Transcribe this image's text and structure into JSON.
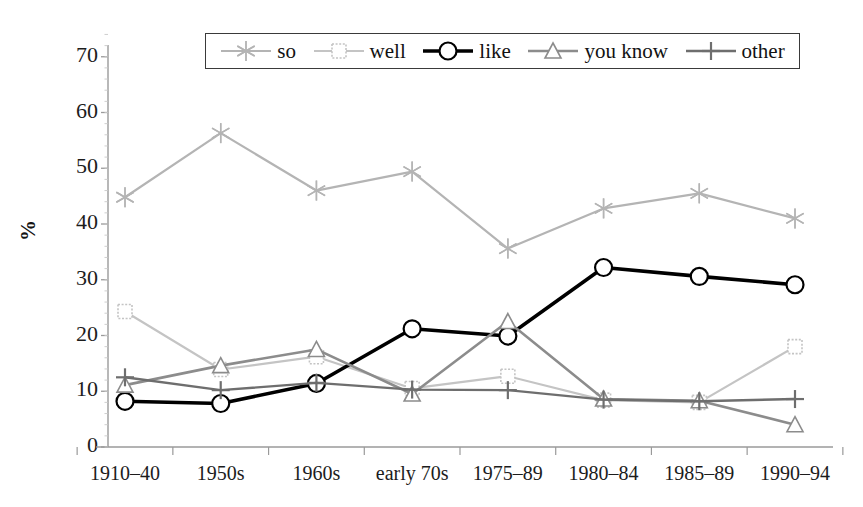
{
  "chart_data": {
    "type": "line",
    "title": "",
    "xlabel": "",
    "ylabel": "%",
    "ylim": [
      0,
      70
    ],
    "yticks": [
      0,
      10,
      20,
      30,
      40,
      50,
      60,
      70
    ],
    "grid": false,
    "legend_position": "top-center",
    "categories": [
      "1910–40",
      "1950s",
      "1960s",
      "early 70s",
      "1975–89",
      "1980–84",
      "1985–89",
      "1990–94"
    ],
    "series": [
      {
        "name": "so",
        "marker": "asterisk",
        "color": "#b4b4b4",
        "line_width": 2.2,
        "values": [
          44.8,
          56.3,
          46.0,
          49.4,
          35.6,
          42.8,
          45.5,
          41.0
        ]
      },
      {
        "name": "well",
        "marker": "square",
        "color": "#c4c4c4",
        "line_width": 2.2,
        "values": [
          24.3,
          13.9,
          16.2,
          10.5,
          12.7,
          8.4,
          8.0,
          18.0
        ]
      },
      {
        "name": "like",
        "marker": "circle",
        "color": "#000000",
        "line_width": 3.6,
        "values": [
          8.2,
          7.8,
          11.4,
          21.2,
          19.9,
          32.2,
          30.6,
          29.1
        ]
      },
      {
        "name": "you know",
        "marker": "triangle",
        "color": "#8c8c8c",
        "line_width": 2.6,
        "values": [
          11.1,
          14.6,
          17.5,
          9.5,
          22.5,
          8.6,
          8.3,
          4.0
        ]
      },
      {
        "name": "other",
        "marker": "plus",
        "color": "#6e6e6e",
        "line_width": 2.4,
        "values": [
          12.5,
          10.2,
          11.5,
          10.3,
          10.2,
          8.5,
          8.2,
          8.6
        ]
      }
    ]
  },
  "legend": {
    "items": [
      {
        "label": "so"
      },
      {
        "label": "well"
      },
      {
        "label": "like"
      },
      {
        "label": "you know"
      },
      {
        "label": "other"
      }
    ]
  },
  "axes": {
    "y_label": "%",
    "y_tick_labels": [
      "70",
      "60",
      "50",
      "40",
      "30",
      "20",
      "10",
      "0"
    ],
    "x_tick_labels": [
      "1910–40",
      "1950s",
      "1960s",
      "early 70s",
      "1975–89",
      "1980–84",
      "1985–89",
      "1990–94"
    ]
  },
  "colors": {
    "axis": "#9a9a9a",
    "text": "#1c1c1c",
    "so": "#b4b4b4",
    "well": "#c4c4c4",
    "like": "#000000",
    "you_know": "#8c8c8c",
    "other": "#6e6e6e"
  }
}
